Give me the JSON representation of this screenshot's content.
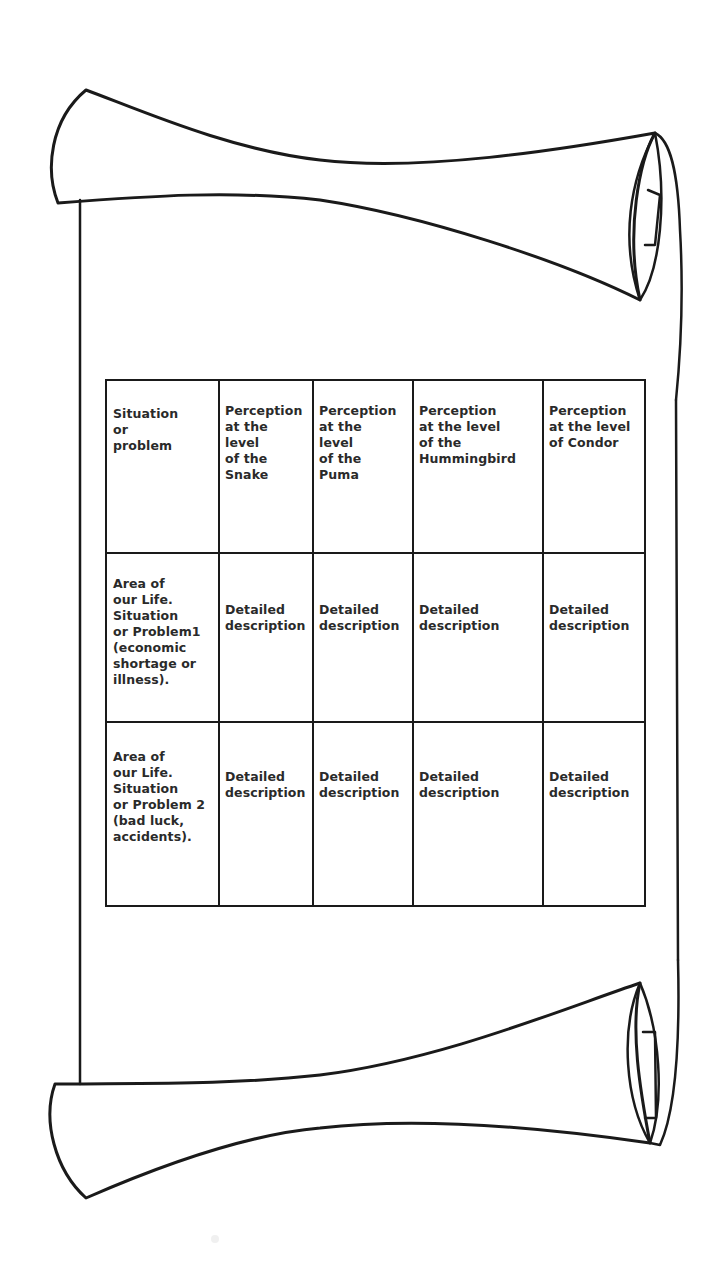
{
  "figure": {
    "type": "scroll-table",
    "colors": {
      "line": "#1a1a1a",
      "text": "#2a2a2a",
      "background": "#ffffff"
    }
  },
  "table": {
    "header": [
      "Situation\nor\nproblem",
      "Perception\nat the\nlevel\nof the\nSnake",
      "Perception\nat the\nlevel\nof the\nPuma",
      "Perception\nat the level\nof the\nHummingbird",
      "Perception\nat the level\nof Condor"
    ],
    "rows": [
      {
        "label": "Area of\nour Life.\nSituation\nor Problem1\n(economic\nshortage or\nillness).",
        "cells": [
          "Detailed\ndescription",
          "Detailed\ndescription",
          "Detailed\ndescription",
          "Detailed\ndescription"
        ]
      },
      {
        "label": "Area of\nour Life.\nSituation\nor Problem 2\n(bad luck,\naccidents).",
        "cells": [
          "Detailed\ndescription",
          "Detailed\ndescription",
          "Detailed\ndescription",
          "Detailed\ndescription"
        ]
      }
    ]
  }
}
